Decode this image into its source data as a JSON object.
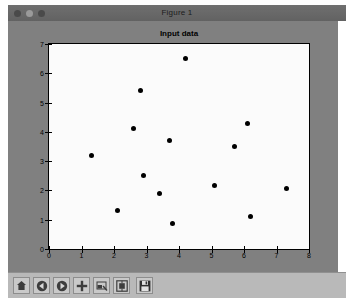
{
  "window": {
    "title": "Figure 1",
    "controls": [
      {
        "name": "close",
        "color": "#4a4a4a"
      },
      {
        "name": "minimize",
        "color": "#9a9a9a"
      },
      {
        "name": "maximize",
        "color": "#4a4a4a"
      }
    ]
  },
  "toolbar": {
    "items": [
      {
        "icon": "home-icon",
        "label": "Home"
      },
      {
        "icon": "back-arrow-icon",
        "label": "Back"
      },
      {
        "icon": "forward-arrow-icon",
        "label": "Forward"
      },
      {
        "icon": "pan-move-icon",
        "label": "Pan"
      },
      {
        "icon": "zoom-rect-icon",
        "label": "Zoom to rectangle"
      },
      {
        "icon": "configure-subplots-icon",
        "label": "Configure subplots"
      },
      {
        "icon": "save-disk-icon",
        "label": "Save the figure"
      }
    ]
  },
  "colors": {
    "figure_background": "#808080",
    "axes_background": "#fbfbfb",
    "marker": "#000000",
    "titlebar": "#626262",
    "toolbar": "#b9b9b9"
  },
  "chart_data": {
    "type": "scatter",
    "title": "Input data",
    "xlabel": "",
    "ylabel": "",
    "xlim": [
      0,
      8
    ],
    "ylim": [
      0,
      7
    ],
    "xticks": [
      0,
      1,
      2,
      3,
      4,
      5,
      6,
      7,
      8
    ],
    "yticks": [
      0,
      1,
      2,
      3,
      4,
      5,
      6,
      7
    ],
    "xticklabels": [
      "0",
      "1",
      "2",
      "3",
      "4",
      "5",
      "6",
      "7",
      "8"
    ],
    "yticklabels": [
      "0",
      "1",
      "2",
      "3",
      "4",
      "5",
      "6",
      "7"
    ],
    "grid": false,
    "legend": null,
    "marker": "o",
    "marker_color": "#000000",
    "marker_size": 5,
    "points": [
      {
        "x": 4.2,
        "y": 6.5
      },
      {
        "x": 2.8,
        "y": 5.4
      },
      {
        "x": 6.1,
        "y": 4.28
      },
      {
        "x": 2.6,
        "y": 4.1
      },
      {
        "x": 3.7,
        "y": 3.7
      },
      {
        "x": 5.7,
        "y": 3.5
      },
      {
        "x": 1.3,
        "y": 3.2
      },
      {
        "x": 2.9,
        "y": 2.5
      },
      {
        "x": 5.1,
        "y": 2.17
      },
      {
        "x": 7.3,
        "y": 2.08
      },
      {
        "x": 3.4,
        "y": 1.9
      },
      {
        "x": 2.1,
        "y": 1.3
      },
      {
        "x": 6.2,
        "y": 1.1
      },
      {
        "x": 3.8,
        "y": 0.88
      }
    ]
  }
}
